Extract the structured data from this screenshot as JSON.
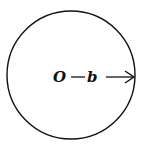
{
  "diagram": {
    "type": "circle-with-radius",
    "circle": {
      "cx": 71,
      "cy": 75,
      "r": 64,
      "stroke": "#111111"
    },
    "center_label": "O",
    "radius_label": "b",
    "arrow": "radius-arrow-pointing-right",
    "colors": {
      "ink": "#111111",
      "background": "#ffffff"
    }
  }
}
